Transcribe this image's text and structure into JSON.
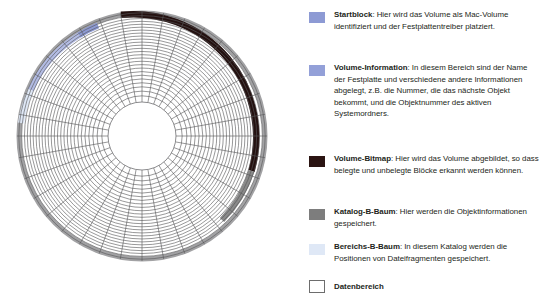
{
  "figure": {
    "name": "hard-disk-platter-diagram",
    "geometry": {
      "center_x": 134,
      "center_y": 132,
      "outer_radius": 126,
      "inner_radius": 34,
      "sector_count": 36,
      "track_count": 26
    },
    "ring_segments": [
      {
        "name": "startblock",
        "label": "Startblock",
        "color": "#8d9ad4",
        "start_deg": 291,
        "end_deg": 300
      },
      {
        "name": "volume-info",
        "label": "Volume-Information",
        "color": "#aab5e0",
        "start_deg": 300,
        "end_deg": 326
      },
      {
        "name": "volume-bitmap",
        "label": "Volume-Bitmap",
        "color": "#2b1412",
        "start_deg": 338,
        "end_deg": 30
      },
      {
        "name": "katalog-b-baum",
        "label": "Katalog-B-Baum",
        "color": "#8a8a8a",
        "start_deg": 30,
        "end_deg": 58
      },
      {
        "name": "bereichs-b-baum",
        "label": "Bereichs-B-Baum",
        "color": "#dfe8f6",
        "start_deg": 326,
        "end_deg": 338
      },
      {
        "name": "datenbereich",
        "label": "Datenbereich",
        "color": "#ffffff",
        "start_deg": 58,
        "end_deg": 291
      }
    ],
    "colors": {
      "track_line": "#58585a",
      "sector_line": "#58585a",
      "outer_ring_default": "#9b9b9b",
      "background": "#ffffff"
    }
  },
  "legend": {
    "items": [
      {
        "id": "startblock",
        "swatch_color": "#8d9ad4",
        "term": "Startblock",
        "separator": ":",
        "description": " Hier wird das Volume als Mac-Volume identifiziert und der Festplattentreiber platziert."
      },
      {
        "id": "volume-information",
        "swatch_color": "#93a0d8",
        "term": "Volume-Information",
        "separator": ":",
        "description": " In diesem Bereich sind der Name der Festplatte und verschiedene andere Informationen abgelegt, z.B. die Nummer, die das nächste Objekt bekommt, und die Objektnummer des aktiven Systemordners."
      },
      {
        "id": "volume-bitmap",
        "swatch_color": "#2b1412",
        "term": "Volume-Bitmap",
        "separator": ":",
        "description": " Hier wird das Volume abgebildet, so dass belegte und unbelegte Blöcke erkannt werden können."
      },
      {
        "id": "katalog-b-baum",
        "swatch_color": "#7d7d7d",
        "term": "Katalog-B-Baum",
        "separator": ":",
        "description": " Hier werden die Objektinformationen gespeichert."
      },
      {
        "id": "bereichs-b-baum",
        "swatch_color": "#dfe8f6",
        "term": "Bereichs-B-Baum",
        "separator": ":",
        "description": " In diesem Katalog werden die Positionen von Dateifragmenten gespeichert."
      },
      {
        "id": "datenbereich",
        "swatch_color": "#ffffff",
        "swatch_border": "#6d6d6d",
        "term": "Datenbereich",
        "separator": "",
        "description": ""
      }
    ]
  }
}
